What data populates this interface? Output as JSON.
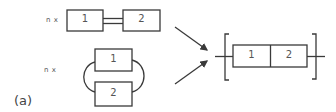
{
  "diagram": {
    "caption": "(a)",
    "left": {
      "series_config": {
        "multiplier_label": "n x",
        "boxes": [
          {
            "label": "1"
          },
          {
            "label": "2"
          }
        ],
        "connection": "double-line"
      },
      "parallel_config": {
        "multiplier_label": "n x",
        "boxes": [
          {
            "label": "1"
          },
          {
            "label": "2"
          }
        ],
        "connection": "curved-loops"
      }
    },
    "arrows": [
      {
        "from": "series_config",
        "to": "result"
      },
      {
        "from": "parallel_config",
        "to": "result"
      }
    ],
    "result": {
      "boxes": [
        {
          "label": "1"
        },
        {
          "label": "2"
        }
      ],
      "enclosure": "square-brackets"
    },
    "colors": {
      "line": "#3a3a3a",
      "text": "#555555",
      "background": "#ffffff"
    }
  }
}
